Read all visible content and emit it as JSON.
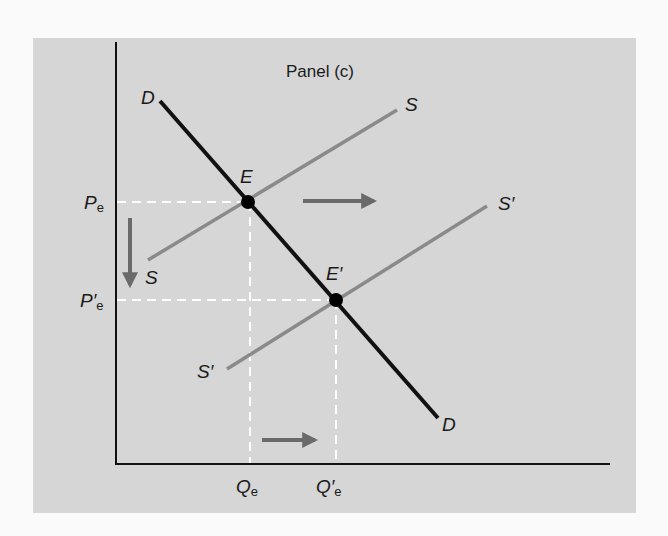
{
  "panel": {
    "title": "Panel (c)",
    "background": "#d6d6d6"
  },
  "labels": {
    "demand_top": "D",
    "demand_bottom": "D",
    "supply_top": "S",
    "supply_bottom": "S",
    "supply_new_top": "S′",
    "supply_new_bottom": "S′",
    "equilibrium": "E",
    "equilibrium_new": "E′",
    "price_eq": "P",
    "price_eq_sub": "e",
    "price_eq_new": "P′",
    "price_eq_new_sub": "e",
    "qty_eq": "Q",
    "qty_eq_sub": "e",
    "qty_eq_new": "Q′",
    "qty_eq_new_sub": "e"
  },
  "colors": {
    "demand_line": "#111111",
    "supply_line": "#8a8a8a",
    "axis": "#111111",
    "dashed_guides": "#ffffff",
    "arrows": "#6a6a6a",
    "points": "#000000"
  },
  "geometry": {
    "y_axis_x": 116,
    "x_axis_y": 464,
    "demand": {
      "x1": 160,
      "y1": 101,
      "x2": 438,
      "y2": 418
    },
    "supply": {
      "x1": 148,
      "y1": 260,
      "x2": 397,
      "y2": 110
    },
    "supply_new": {
      "x1": 227,
      "y1": 369,
      "x2": 487,
      "y2": 206
    },
    "E": {
      "x": 248,
      "y": 202
    },
    "E_new": {
      "x": 336,
      "y": 300
    },
    "arrow_right_top": {
      "x1": 303,
      "x2": 377,
      "y": 201
    },
    "arrow_down": {
      "x": 130,
      "y1": 218,
      "y2": 288
    },
    "arrow_right_bottom": {
      "x1": 262,
      "x2": 318,
      "y": 440
    }
  }
}
